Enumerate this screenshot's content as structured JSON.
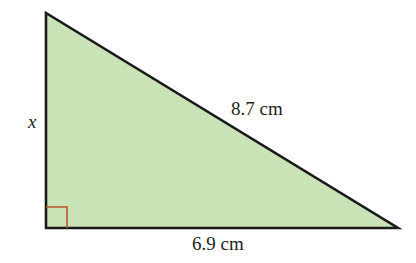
{
  "diagram": {
    "type": "right-triangle",
    "vertices": {
      "top": [
        46,
        13
      ],
      "right_angle": [
        46,
        228
      ],
      "right": [
        398,
        228
      ]
    },
    "fill_color": "#c9e3b6",
    "stroke_color": "#1a1a1a",
    "right_angle_marker_color": "#b5562a",
    "labels": {
      "vertical_side": "x",
      "hypotenuse": "8.7 cm",
      "base": "6.9 cm"
    }
  }
}
